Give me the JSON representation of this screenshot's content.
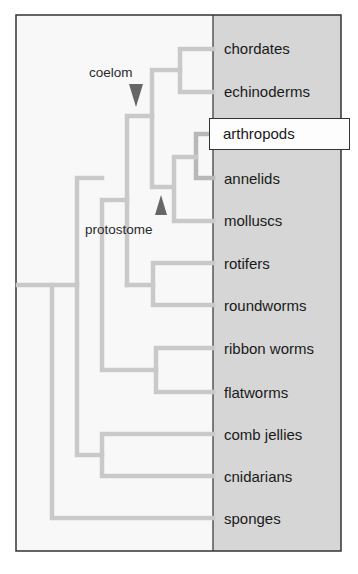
{
  "diagram": {
    "type": "phylogenetic-tree",
    "taxa": [
      {
        "label": "chordates",
        "y": 48
      },
      {
        "label": "echinoderms",
        "y": 91
      },
      {
        "label": "arthropods",
        "y": 134,
        "highlighted": true
      },
      {
        "label": "annelids",
        "y": 178
      },
      {
        "label": "molluscs",
        "y": 220
      },
      {
        "label": "rotifers",
        "y": 263
      },
      {
        "label": "roundworms",
        "y": 305
      },
      {
        "label": "ribbon worms",
        "y": 348
      },
      {
        "label": "flatworms",
        "y": 392
      },
      {
        "label": "comb jellies",
        "y": 434
      },
      {
        "label": "cnidarians",
        "y": 476
      },
      {
        "label": "sponges",
        "y": 518
      }
    ],
    "annotations": {
      "coelom": {
        "label": "coelom",
        "arrow": "down"
      },
      "protostome": {
        "label": "protostome",
        "arrow": "up"
      }
    },
    "colors": {
      "branch": "#c9c9c9",
      "panel": "#d6d6d6",
      "background": "#f8f8f8",
      "border": "#333333",
      "arrow": "#666666"
    }
  }
}
